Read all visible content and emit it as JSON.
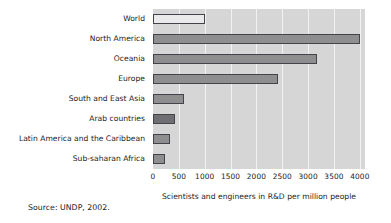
{
  "chart_data": {
    "type": "bar",
    "orientation": "horizontal",
    "title": "",
    "subtitle": "",
    "xlabel": "Scientists and engineers in R&D per million people",
    "ylabel": "",
    "categories": [
      "World",
      "North America",
      "Oceania",
      "Europe",
      "South and East Asia",
      "Arab countries",
      "Latin America and the Caribbean",
      "Sub-saharan Africa"
    ],
    "values": [
      1010,
      4000,
      3180,
      2420,
      590,
      420,
      320,
      230
    ],
    "xlim": [
      0,
      4100
    ],
    "xticks": [
      0,
      500,
      1000,
      1500,
      2000,
      2500,
      3000,
      3500,
      4000
    ],
    "xtick_labels": [
      "0",
      "500",
      "1000",
      "1500",
      "2000",
      "2500",
      "3000",
      "3500",
      "4000"
    ],
    "grid": "vertical-white-gridlines",
    "legend": "none",
    "plot_background": "#d6d6d6",
    "bar_fill": "#8e8e8e",
    "bar_fill_light": "#e9e9e9",
    "bar_fill_dark": "#6e6e73",
    "bar_border": "#43434a"
  },
  "source_note": "Source: UNDP, 2002."
}
